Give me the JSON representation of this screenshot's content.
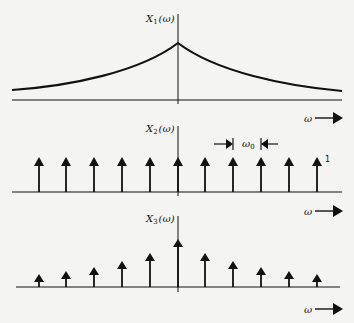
{
  "panels": [
    {
      "id": "x1",
      "label": "X",
      "label_sub": "1",
      "label_arg": "(ω)",
      "type": "continuous",
      "description": "two-sided decaying exponential peaking at ω = 0",
      "axis_label": "ω"
    },
    {
      "id": "x2",
      "label": "X",
      "label_sub": "2",
      "label_arg": "(ω)",
      "type": "impulse-train",
      "impulse_count": 11,
      "impulse_height_label": "1",
      "spacing_label": "ω",
      "spacing_sub": "0",
      "axis_label": "ω"
    },
    {
      "id": "x3",
      "label": "X",
      "label_sub": "3",
      "label_arg": "(ω)",
      "type": "sampled-impulses",
      "impulse_count": 11,
      "description": "impulse train weighted by X1(ω) envelope",
      "axis_label": "ω"
    }
  ],
  "colors": {
    "ink": "#111111",
    "paper": "#f4f4f2"
  }
}
